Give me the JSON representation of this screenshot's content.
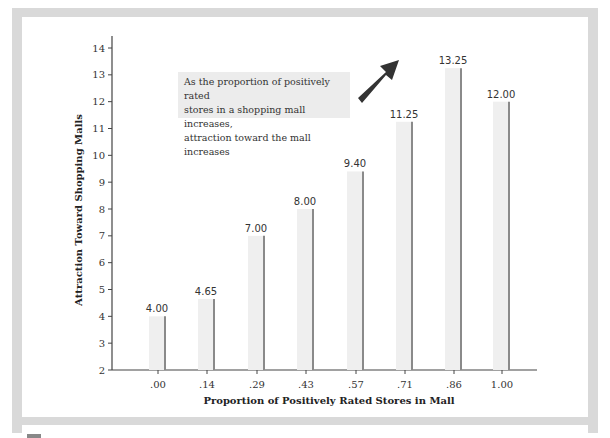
{
  "chart_data": {
    "type": "bar",
    "title": "",
    "xlabel": "Proportion of Positively Rated Stores in Mall",
    "ylabel": "Attraction Toward Shopping Malls",
    "categories": [
      ".00",
      ".14",
      ".29",
      ".43",
      ".57",
      ".71",
      ".86",
      "1.00"
    ],
    "values": [
      4.0,
      4.65,
      7.0,
      8.0,
      9.4,
      11.25,
      13.25,
      12.0
    ],
    "value_labels": [
      "4.00",
      "4.65",
      "7.00",
      "8.00",
      "9.40",
      "11.25",
      "13.25",
      "12.00"
    ],
    "ylim": [
      2,
      14
    ],
    "yticks": [
      2,
      3,
      4,
      5,
      6,
      7,
      8,
      9,
      10,
      11,
      12,
      13,
      14
    ],
    "grid": false,
    "legend": null,
    "annotations": [
      {
        "text": "As the proportion of positively rated stores in a shopping mall increases, attraction toward the mall increases",
        "lines": [
          "As the proportion of positively rated",
          "stores in a shopping mall increases,",
          "attraction toward the mall increases"
        ],
        "arrow": "up-right"
      }
    ]
  },
  "colors": {
    "frame": "#d9d9d9",
    "bar_fill": "#efefef",
    "bar_edge": "#8a8a8a",
    "arrow": "#333333",
    "note_bg": "#ececec"
  }
}
